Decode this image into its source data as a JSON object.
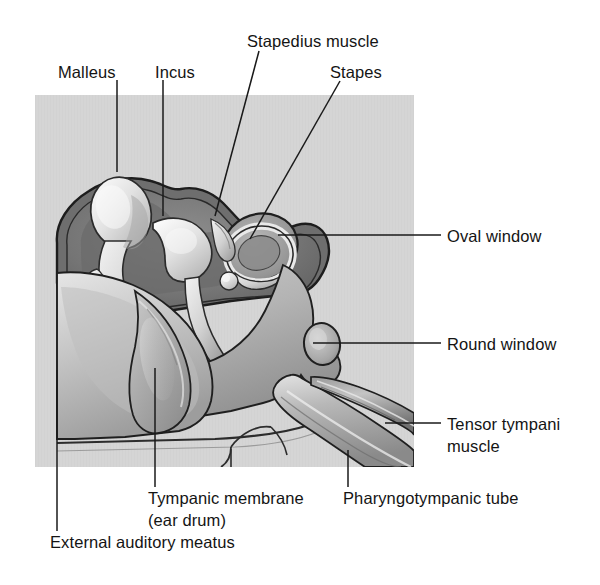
{
  "figure": {
    "background_color": "#ffffff",
    "panel_color": "#d4d4d4",
    "line_color": "#1a1a1a",
    "text_color": "#141414"
  },
  "labels": [
    {
      "id": "malleus",
      "text": "Malleus",
      "x": 58,
      "y": 62,
      "leader": {
        "type": "v",
        "x": 117,
        "y1": 80,
        "y2": 172
      }
    },
    {
      "id": "incus",
      "text": "Incus",
      "x": 155,
      "y": 62,
      "leader": {
        "type": "v",
        "x": 163,
        "y1": 80,
        "y2": 216
      }
    },
    {
      "id": "stapedius-muscle",
      "text": "Stapedius muscle",
      "x": 247,
      "y": 31,
      "leader": {
        "type": "d",
        "x1": 259,
        "y1": 51,
        "x2": 215,
        "y2": 216
      }
    },
    {
      "id": "stapes",
      "text": "Stapes",
      "x": 330,
      "y": 62,
      "leader": {
        "type": "d",
        "x1": 340,
        "y1": 81,
        "x2": 250,
        "y2": 239
      }
    },
    {
      "id": "oval-window",
      "text": "Oval window",
      "x": 447,
      "y": 226,
      "leader": {
        "type": "h",
        "x1": 278,
        "y1": 235,
        "x2": 441
      }
    },
    {
      "id": "round-window",
      "text": "Round window",
      "x": 447,
      "y": 334,
      "leader": {
        "type": "h",
        "x1": 313,
        "y1": 343,
        "x2": 441
      }
    },
    {
      "id": "tensor-tympani-muscle",
      "text": "Tensor tympani muscle",
      "line1": "Tensor tympani",
      "line2": "muscle",
      "x": 447,
      "y": 414,
      "leader": {
        "type": "h",
        "x1": 385,
        "y1": 423,
        "x2": 441
      }
    },
    {
      "id": "tympanic-membrane",
      "text": "Tympanic membrane (ear drum)",
      "line1": "Tympanic membrane",
      "line2": "(ear drum)",
      "x": 148,
      "y": 488,
      "leader": {
        "type": "v",
        "x": 155,
        "y1": 368,
        "y2": 487
      }
    },
    {
      "id": "pharyngotympanic-tube",
      "text": "Pharyngotympanic tube",
      "x": 343,
      "y": 488,
      "leader": {
        "type": "v",
        "x": 348,
        "y1": 450,
        "y2": 487
      }
    },
    {
      "id": "external-auditory-meatus",
      "text": "External auditory meatus",
      "x": 50,
      "y": 532,
      "leader": {
        "type": "v",
        "x": 57,
        "y1": 370,
        "y2": 531
      }
    }
  ],
  "illustration": {
    "description": "Grayscale medical illustration cutaway of the middle ear",
    "structures": [
      {
        "name": "external-auditory-meatus",
        "label": "External auditory meatus"
      },
      {
        "name": "tympanic-membrane",
        "label": "Tympanic membrane (ear drum)"
      },
      {
        "name": "malleus",
        "label": "Malleus"
      },
      {
        "name": "incus",
        "label": "Incus"
      },
      {
        "name": "stapes",
        "label": "Stapes"
      },
      {
        "name": "stapedius-muscle",
        "label": "Stapedius muscle"
      },
      {
        "name": "oval-window",
        "label": "Oval window"
      },
      {
        "name": "round-window",
        "label": "Round window"
      },
      {
        "name": "tensor-tympani-muscle",
        "label": "Tensor tympani muscle"
      },
      {
        "name": "pharyngotympanic-tube",
        "label": "Pharyngotympanic tube"
      }
    ]
  }
}
